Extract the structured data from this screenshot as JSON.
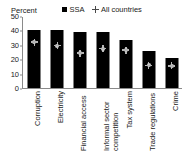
{
  "chart_data": {
    "type": "bar",
    "title": "",
    "subtitle": "",
    "xlabel": "",
    "ylabel": "Percent",
    "ylim": [
      0,
      50
    ],
    "yticks": [
      "0",
      "10",
      "20",
      "30",
      "40",
      "50"
    ],
    "grid": false,
    "legend_position": "top-right",
    "categories": [
      "Corruption",
      "Electricity",
      "Financial access",
      "Informal sector competition",
      "Tax system",
      "Trade regulations",
      "Crime"
    ],
    "series": [
      {
        "name": "SSA",
        "marker": "square",
        "color": "#000000",
        "values": [
          40,
          40,
          39,
          39,
          33,
          25.5,
          21
        ]
      },
      {
        "name": "All countries",
        "marker": "diamond-cross",
        "color": "#c9c9c9",
        "values": [
          32.5,
          30,
          25,
          28,
          27,
          16.5,
          16
        ]
      }
    ]
  },
  "legend": {
    "items": [
      {
        "label": "SSA",
        "icon": "filled-square-marker"
      },
      {
        "label": "All countries",
        "icon": "diamond-cross-marker"
      }
    ]
  },
  "axis": {
    "y_title": "Percent"
  },
  "colors": {
    "bar": "#000000",
    "marker": "#c9c9c9",
    "axis": "#8a8a8a",
    "text": "#1a1a1a",
    "background": "#ffffff"
  }
}
